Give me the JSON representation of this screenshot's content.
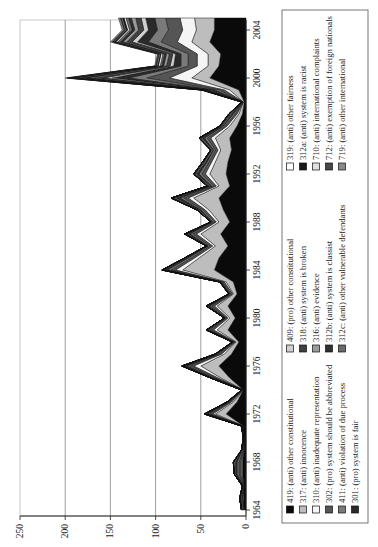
{
  "chart_data": {
    "type": "area",
    "stacked": true,
    "orientation": "rotated-90-clockwise",
    "title": "",
    "xlabel": "",
    "ylabel": "",
    "x": [
      1964,
      1965,
      1966,
      1967,
      1968,
      1969,
      1970,
      1971,
      1972,
      1973,
      1974,
      1975,
      1976,
      1977,
      1978,
      1979,
      1980,
      1981,
      1982,
      1983,
      1984,
      1985,
      1986,
      1987,
      1988,
      1989,
      1990,
      1991,
      1992,
      1993,
      1994,
      1995,
      1996,
      1997,
      1998,
      1999,
      2000,
      2001,
      2002,
      2003,
      2004,
      2005
    ],
    "x_ticks": [
      1964,
      1968,
      1972,
      1976,
      1980,
      1984,
      1988,
      1992,
      1996,
      2000,
      2004
    ],
    "y_ticks": [
      0,
      50,
      100,
      150,
      200,
      250
    ],
    "ylim": [
      0,
      250
    ],
    "grid": true,
    "legend_position": "right",
    "series": [
      {
        "name": "419: (anti) other constitutional",
        "color": "#0a0a0a",
        "values": [
          2,
          3,
          2,
          4,
          4,
          2,
          2,
          3,
          22,
          10,
          3,
          18,
          30,
          16,
          8,
          20,
          12,
          20,
          10,
          14,
          35,
          30,
          20,
          28,
          18,
          25,
          30,
          18,
          22,
          20,
          16,
          18,
          10,
          4,
          2,
          8,
          40,
          30,
          28,
          40,
          35,
          35
        ]
      },
      {
        "name": "317: (anti) innocence",
        "color": "#bdbdbd",
        "values": [
          0,
          1,
          0,
          1,
          1,
          0,
          0,
          0,
          12,
          4,
          0,
          10,
          20,
          8,
          3,
          12,
          6,
          12,
          4,
          8,
          35,
          22,
          14,
          22,
          12,
          16,
          28,
          12,
          18,
          14,
          12,
          16,
          8,
          4,
          1,
          10,
          20,
          12,
          14,
          20,
          20,
          22
        ]
      },
      {
        "name": "310: (anti) inadequate representation",
        "color": "#f5f5f5",
        "values": [
          0,
          0,
          0,
          1,
          1,
          0,
          0,
          0,
          3,
          2,
          0,
          3,
          8,
          3,
          1,
          4,
          2,
          3,
          1,
          2,
          8,
          5,
          3,
          5,
          3,
          4,
          6,
          3,
          5,
          4,
          3,
          5,
          3,
          2,
          0,
          6,
          25,
          12,
          12,
          16,
          15,
          16
        ]
      },
      {
        "name": "302: (pro) system should be abbreviated",
        "color": "#555555",
        "values": [
          1,
          1,
          1,
          2,
          2,
          1,
          0,
          1,
          3,
          2,
          1,
          3,
          4,
          2,
          1,
          3,
          2,
          3,
          2,
          2,
          5,
          4,
          3,
          4,
          2,
          3,
          5,
          3,
          4,
          3,
          3,
          4,
          2,
          2,
          1,
          6,
          25,
          10,
          10,
          18,
          16,
          16
        ]
      },
      {
        "name": "411: (anti) violation of due process",
        "color": "#7a7a7a",
        "values": [
          1,
          1,
          0,
          2,
          2,
          1,
          0,
          0,
          2,
          1,
          0,
          2,
          3,
          2,
          1,
          2,
          1,
          2,
          1,
          1,
          4,
          3,
          2,
          3,
          2,
          2,
          4,
          2,
          3,
          2,
          2,
          3,
          2,
          2,
          0,
          5,
          20,
          8,
          8,
          14,
          12,
          12
        ]
      },
      {
        "name": "301: (pro) system is fair",
        "color": "#2a2a2a",
        "values": [
          1,
          1,
          1,
          2,
          2,
          1,
          1,
          1,
          2,
          1,
          1,
          1,
          3,
          1,
          1,
          1,
          1,
          2,
          1,
          1,
          3,
          2,
          1,
          3,
          1,
          2,
          5,
          2,
          3,
          2,
          1,
          3,
          1,
          2,
          1,
          4,
          18,
          8,
          6,
          12,
          10,
          10
        ]
      },
      {
        "name": "409: (pro) other constitutional",
        "color": "#d0d0d0",
        "values": [
          0,
          0,
          0,
          1,
          1,
          0,
          0,
          0,
          1,
          1,
          0,
          1,
          1,
          1,
          0,
          1,
          0,
          1,
          0,
          1,
          1,
          1,
          1,
          1,
          1,
          1,
          2,
          1,
          1,
          1,
          1,
          1,
          1,
          1,
          0,
          2,
          10,
          4,
          3,
          6,
          5,
          5
        ]
      },
      {
        "name": "318: (anti) system is broken",
        "color": "#404040",
        "values": [
          0,
          0,
          0,
          0,
          1,
          0,
          0,
          0,
          1,
          0,
          0,
          1,
          1,
          1,
          0,
          1,
          0,
          1,
          0,
          0,
          1,
          1,
          0,
          1,
          0,
          1,
          2,
          1,
          1,
          1,
          1,
          1,
          1,
          1,
          0,
          2,
          10,
          4,
          4,
          6,
          6,
          6
        ]
      },
      {
        "name": "316: (anti) evidence",
        "color": "#9a9a9a",
        "values": [
          0,
          0,
          0,
          0,
          0,
          0,
          0,
          0,
          0,
          0,
          0,
          0,
          1,
          0,
          0,
          0,
          0,
          0,
          0,
          0,
          1,
          0,
          0,
          1,
          0,
          0,
          1,
          1,
          1,
          1,
          0,
          1,
          1,
          1,
          0,
          2,
          8,
          3,
          3,
          4,
          4,
          5
        ]
      },
      {
        "name": "312b: (anti) system is classist",
        "color": "#303030",
        "values": [
          0,
          0,
          0,
          0,
          0,
          0,
          0,
          0,
          0,
          0,
          0,
          0,
          0,
          0,
          0,
          0,
          0,
          0,
          0,
          0,
          0,
          0,
          0,
          0,
          0,
          0,
          0,
          0,
          0,
          0,
          0,
          0,
          0,
          0,
          0,
          1,
          6,
          2,
          2,
          3,
          3,
          3
        ]
      },
      {
        "name": "312c: (anti) other vulnerable defendants",
        "color": "#6a6a6a",
        "values": [
          0,
          0,
          0,
          0,
          0,
          0,
          0,
          0,
          0,
          0,
          0,
          0,
          0,
          0,
          0,
          0,
          0,
          0,
          0,
          0,
          0,
          0,
          0,
          0,
          0,
          0,
          0,
          0,
          0,
          0,
          0,
          0,
          0,
          0,
          0,
          1,
          5,
          2,
          2,
          3,
          3,
          3
        ]
      },
      {
        "name": "319: (anti) other fairness",
        "color": "#ffffff",
        "values": [
          0,
          0,
          0,
          0,
          0,
          0,
          0,
          0,
          0,
          0,
          0,
          0,
          0,
          0,
          0,
          0,
          0,
          0,
          0,
          0,
          0,
          0,
          0,
          0,
          0,
          0,
          0,
          0,
          0,
          0,
          0,
          0,
          0,
          0,
          0,
          1,
          4,
          2,
          2,
          2,
          2,
          2
        ]
      },
      {
        "name": "312a: (anti) system is racist",
        "color": "#1a1a1a",
        "values": [
          0,
          0,
          0,
          0,
          0,
          0,
          0,
          0,
          0,
          0,
          0,
          0,
          0,
          0,
          0,
          0,
          0,
          0,
          0,
          0,
          0,
          0,
          0,
          0,
          0,
          0,
          0,
          0,
          0,
          0,
          0,
          0,
          0,
          0,
          0,
          1,
          3,
          1,
          1,
          2,
          2,
          2
        ]
      },
      {
        "name": "710: (anti) international complaints",
        "color": "#e0e0e0",
        "values": [
          0,
          0,
          0,
          0,
          0,
          0,
          0,
          0,
          0,
          0,
          0,
          0,
          0,
          0,
          0,
          0,
          0,
          0,
          0,
          0,
          0,
          0,
          0,
          0,
          0,
          0,
          0,
          0,
          0,
          0,
          0,
          0,
          0,
          0,
          0,
          0,
          2,
          1,
          1,
          1,
          1,
          1
        ]
      },
      {
        "name": "712: (anti) exemption of foreign nationals",
        "color": "#484848",
        "values": [
          0,
          0,
          0,
          0,
          0,
          0,
          0,
          0,
          0,
          0,
          0,
          0,
          0,
          0,
          0,
          0,
          0,
          0,
          0,
          0,
          0,
          0,
          0,
          0,
          0,
          0,
          0,
          0,
          0,
          0,
          0,
          0,
          0,
          0,
          0,
          0,
          2,
          1,
          1,
          1,
          1,
          1
        ]
      },
      {
        "name": "719: (anti) other international",
        "color": "#8a8a8a",
        "values": [
          0,
          0,
          0,
          0,
          0,
          0,
          0,
          0,
          0,
          0,
          0,
          0,
          0,
          0,
          0,
          0,
          0,
          0,
          0,
          0,
          0,
          0,
          0,
          0,
          0,
          0,
          0,
          0,
          0,
          0,
          0,
          0,
          0,
          0,
          0,
          0,
          2,
          1,
          1,
          2,
          2,
          2
        ]
      }
    ]
  },
  "legend": {
    "columns": [
      [
        {
          "label": "419: (anti) other constitutional",
          "swatch": "#0a0a0a"
        },
        {
          "label": "317: (anti) innocence",
          "swatch": "#bdbdbd"
        },
        {
          "label": "310: (anti) inadequate representation",
          "swatch": "#f5f5f5"
        },
        {
          "label": "302: (pro) system should be abbreviated",
          "swatch": "#555555"
        },
        {
          "label": "411: (anti) violation of due process",
          "swatch": "#7a7a7a"
        },
        {
          "label": "301: (pro) system is fair",
          "swatch": "#2a2a2a"
        }
      ],
      [
        {
          "label": "409: (pro) other constitutional",
          "swatch": "#d0d0d0"
        },
        {
          "label": "318: (anti) system is broken",
          "swatch": "#404040"
        },
        {
          "label": "316: (anti) evidence",
          "swatch": "#9a9a9a"
        },
        {
          "label": "312b: (anti) system is classist",
          "swatch": "#303030"
        },
        {
          "label": "312c: (anti) other vulnerable defendants",
          "swatch": "#6a6a6a"
        }
      ],
      [
        {
          "label": "319: (anti) other fairness",
          "swatch": "#ffffff"
        },
        {
          "label": "312a: (anti) system is racist",
          "swatch": "#1a1a1a"
        },
        {
          "label": "710: (anti) international complaints",
          "swatch": "#e0e0e0"
        },
        {
          "label": "712: (anti) exemption of foreign nationals",
          "swatch": "#484848"
        },
        {
          "label": "719: (anti) other international",
          "swatch": "#8a8a8a"
        }
      ]
    ]
  }
}
